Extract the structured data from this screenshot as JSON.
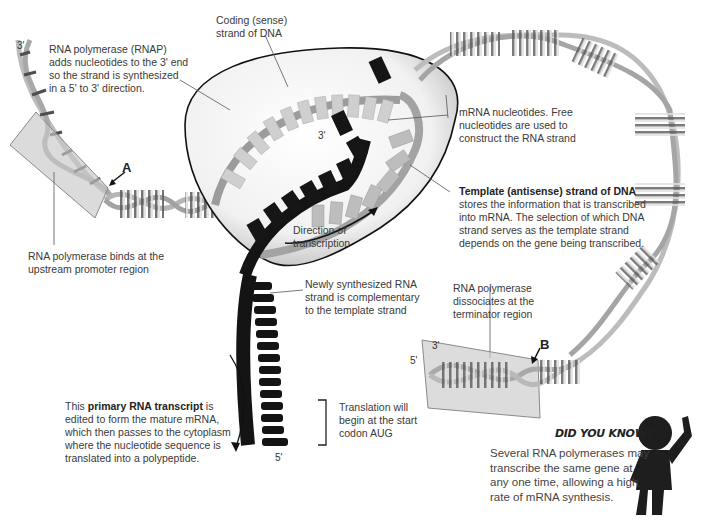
{
  "diagram": {
    "strand_ends": {
      "left_top": "3'",
      "bubble_rna_3": "3'",
      "rna_bottom_5": "5'",
      "right_box_3": "3'",
      "right_box_5": "5'"
    },
    "markers": {
      "a": "A",
      "b": "B"
    },
    "labels": {
      "rnap_adds": "RNA polymerase (RNAP) adds nucleotides to the 3' end so the strand is synthesized in a 5' to 3' direction.",
      "rnap_adds_lines": [
        "RNA polymerase (RNAP)",
        "adds nucleotides to the 3' end",
        "so the strand is synthesized",
        "in a 5' to 3' direction."
      ],
      "coding_strand_lines": [
        "Coding (sense)",
        "strand of DNA"
      ],
      "mrna_nucleotides_lines": [
        "mRNA nucleotides. Free",
        "nucleotides are used to",
        "construct the RNA strand"
      ],
      "template_title": "Template (antisense) strand of DNA",
      "template_lines": [
        "stores the information that is transcribed",
        "into mRNA. The selection of which DNA",
        "strand serves as the template strand",
        "depends on the gene being transcribed."
      ],
      "binds_promoter_lines": [
        "RNA polymerase binds at the",
        "upstream promoter region"
      ],
      "direction_lines": [
        "Direction of",
        "transcription"
      ],
      "newly_synth_lines": [
        "Newly synthesized RNA",
        "strand is complementary",
        "to the template strand"
      ],
      "dissociates_lines": [
        "RNA polymerase",
        "dissociates at the",
        "terminator region"
      ],
      "primary_pre": "This ",
      "primary_bold": "primary RNA transcript",
      "primary_post": " is",
      "primary_lines": [
        "edited to form the mature mRNA,",
        "which then passes to the cytoplasm",
        "where the nucleotide sequence is",
        "translated into a polypeptide."
      ],
      "translation_lines": [
        "Translation will",
        "begin at the start",
        "codon AUG"
      ]
    },
    "sequences": {
      "coding_strand": [
        "A",
        "T",
        "C",
        "A",
        "T",
        "C",
        "C",
        "A",
        "A",
        "T",
        "T",
        "G",
        "G"
      ],
      "template_strand": [
        "C",
        "C",
        "A",
        "T",
        "G",
        "G",
        "A"
      ],
      "rna_in_bubble": [
        "A",
        "A",
        "C",
        "A",
        "U",
        "C",
        "C",
        "A",
        "A"
      ],
      "free_nucleotides": [
        "U",
        "U"
      ],
      "rna_tail": [
        "C",
        "G",
        "G",
        "U",
        "A",
        "G",
        "G",
        "C",
        "C",
        "U",
        "C",
        "G",
        "U",
        "A"
      ]
    },
    "did_you_know": {
      "heading": "DID YOU KNOW?",
      "lines": [
        "Several RNA polymerases may",
        "transcribe the same gene at",
        "any one time, allowing a high",
        "rate of mRNA synthesis."
      ]
    },
    "colors": {
      "dna_backbone": "#b8b8b8",
      "dna_rung_dark": "#555555",
      "dna_rung_light": "#d8d8d8",
      "rna_black": "#1a1a1a",
      "bubble_fill": "#efefef",
      "promoter_box": "#c9c9c9",
      "text": "#3a3a3a"
    }
  }
}
